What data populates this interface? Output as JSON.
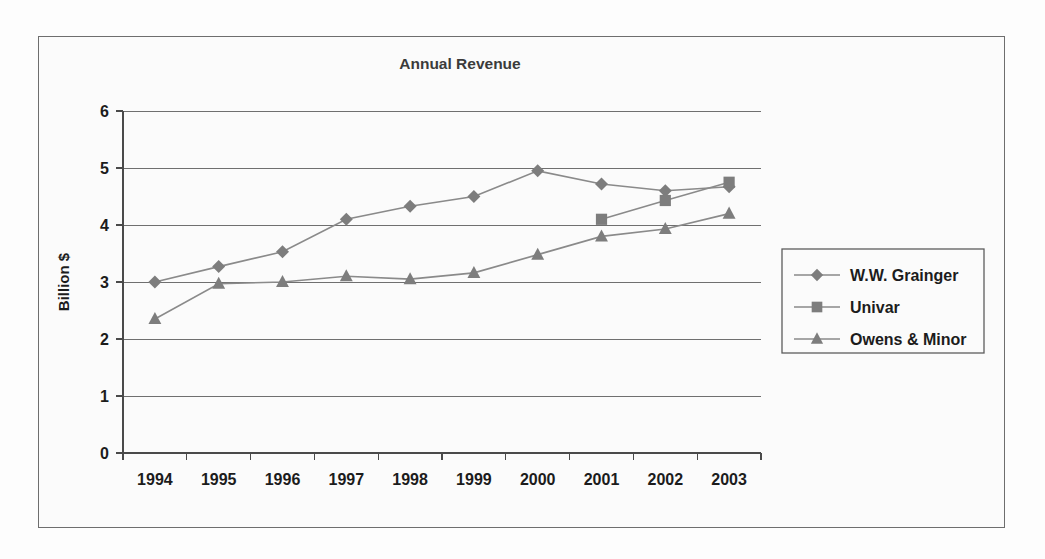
{
  "figure": {
    "title": "Annual Revenue",
    "frame_color": "#6e6e6e",
    "background": "#fbfbfb"
  },
  "axes": {
    "y_axis_label": "Billion $",
    "y_ticks": [
      "0",
      "1",
      "2",
      "3",
      "4",
      "5",
      "6"
    ],
    "x_ticks": [
      "1994",
      "1995",
      "1996",
      "1997",
      "1998",
      "1999",
      "2000",
      "2001",
      "2002",
      "2003"
    ]
  },
  "legend": {
    "position": "right",
    "entries": [
      {
        "label": "W.W. Grainger",
        "marker": "diamond-marker",
        "color": "#7d7d7d"
      },
      {
        "label": "Univar",
        "marker": "square-marker",
        "color": "#7d7d7d"
      },
      {
        "label": "Owens & Minor",
        "marker": "triangle-marker",
        "color": "#7d7d7d"
      }
    ]
  },
  "chart_data": {
    "type": "line",
    "title": "Annual Revenue",
    "xlabel": "",
    "ylabel": "Billion $",
    "ylim": [
      0,
      6
    ],
    "ytick_step": 1,
    "grid": true,
    "legend_position": "right",
    "categories": [
      "1994",
      "1995",
      "1996",
      "1997",
      "1998",
      "1999",
      "2000",
      "2001",
      "2002",
      "2003"
    ],
    "series": [
      {
        "name": "W.W. Grainger",
        "marker": "diamond",
        "color": "#7d7d7d",
        "values": [
          3.0,
          3.27,
          3.53,
          4.1,
          4.33,
          4.5,
          4.95,
          4.72,
          4.6,
          4.67
        ]
      },
      {
        "name": "Univar",
        "marker": "square",
        "color": "#7d7d7d",
        "values": [
          null,
          null,
          null,
          null,
          null,
          null,
          null,
          4.1,
          4.43,
          4.75
        ]
      },
      {
        "name": "Owens & Minor",
        "marker": "triangle",
        "color": "#7d7d7d",
        "values": [
          2.35,
          2.97,
          3.0,
          3.1,
          3.05,
          3.16,
          3.48,
          3.8,
          3.93,
          4.2
        ]
      }
    ]
  }
}
